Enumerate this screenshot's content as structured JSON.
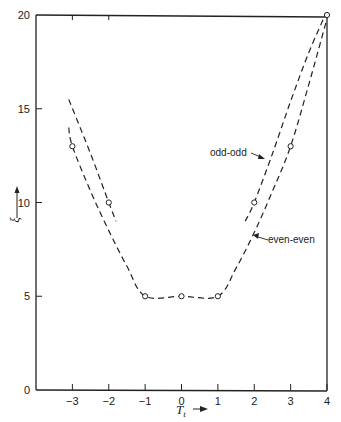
{
  "chart_data": {
    "type": "line",
    "title": "",
    "xlabel": "T_t",
    "xlabel_arrow": "→",
    "ylabel": "ξ",
    "ylabel_arrow": "↑",
    "xlim": [
      -4,
      4
    ],
    "ylim": [
      0,
      20
    ],
    "x_ticks": [
      -3,
      -2,
      -1,
      0,
      1,
      2,
      3,
      4
    ],
    "y_ticks": [
      0,
      5,
      10,
      15,
      20
    ],
    "grid": false,
    "legend": "inline annotations",
    "series": [
      {
        "name": "even-even",
        "style": "dashed",
        "curve": [
          [
            -3.1,
            14
          ],
          [
            -3,
            13
          ],
          [
            -2.5,
            10.6
          ],
          [
            -2,
            8.5
          ],
          [
            -1.5,
            6.6
          ],
          [
            -1,
            5
          ],
          [
            0,
            5
          ],
          [
            1,
            5
          ],
          [
            1.5,
            6.5
          ],
          [
            2,
            8.4
          ],
          [
            2.5,
            10.6
          ],
          [
            3,
            13
          ],
          [
            3.5,
            16.3
          ],
          [
            4,
            19.8
          ]
        ],
        "points": [
          [
            -3,
            13
          ],
          [
            -1,
            5
          ],
          [
            0,
            5
          ],
          [
            1,
            5
          ],
          [
            3,
            13
          ],
          [
            4,
            20
          ]
        ]
      },
      {
        "name": "odd-odd",
        "style": "dashed",
        "segments": [
          [
            [
              -3.1,
              15.5
            ],
            [
              -2.5,
              12.6
            ],
            [
              -2,
              10
            ],
            [
              -1.8,
              9
            ]
          ],
          [
            [
              1.75,
              9
            ],
            [
              2,
              10
            ],
            [
              2.5,
              12.6
            ],
            [
              3,
              15.4
            ],
            [
              3.5,
              18
            ],
            [
              3.95,
              20
            ]
          ]
        ],
        "points": [
          [
            -2,
            10
          ],
          [
            2,
            10
          ]
        ]
      }
    ],
    "annotations": [
      {
        "text": "odd-odd",
        "target_series": "odd-odd",
        "x": 2.6
      },
      {
        "text": "even-even",
        "target_series": "even-even",
        "x": 2.05
      }
    ]
  },
  "labels": {
    "x_ticks": [
      "−3",
      "−2",
      "−1",
      "0",
      "1",
      "2",
      "3",
      "4"
    ],
    "y_ticks": [
      "0",
      "5",
      "10",
      "15",
      "20"
    ],
    "xlabel_main": "T",
    "xlabel_sub": "t",
    "xlabel_arrow": "⟶",
    "ylabel": "ξ",
    "odd_odd": "odd-odd",
    "even_even": "even-even"
  },
  "colors": {
    "ink": "#222222",
    "background": "#ffffff"
  }
}
